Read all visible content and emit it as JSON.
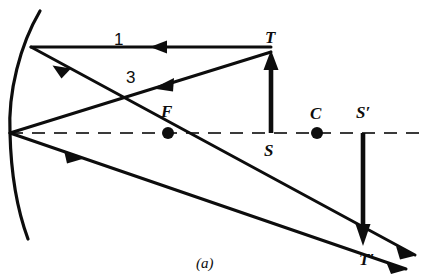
{
  "figure": {
    "caption": "(a)",
    "colors": {
      "ink": "#0d0d0d",
      "background": "#ffffff"
    },
    "labels": [
      {
        "id": "ray-1",
        "text": "1",
        "x": 118,
        "y": 40,
        "style": "num"
      },
      {
        "id": "ray-3",
        "text": "3",
        "x": 130,
        "y": 78,
        "style": "num"
      },
      {
        "id": "point-T",
        "text": "T",
        "x": 271,
        "y": 39,
        "style": "italic"
      },
      {
        "id": "point-F",
        "text": "F",
        "x": 167,
        "y": 113,
        "style": "italic"
      },
      {
        "id": "point-C",
        "text": "C",
        "x": 316,
        "y": 115,
        "style": "italic"
      },
      {
        "id": "point-S2",
        "text": "S′",
        "x": 364,
        "y": 114,
        "style": "italic"
      },
      {
        "id": "point-S",
        "text": "S",
        "x": 270,
        "y": 152,
        "style": "italic"
      },
      {
        "id": "point-T2",
        "text": "T′",
        "x": 367,
        "y": 261,
        "style": "italic"
      }
    ],
    "geometry": {
      "mirror_arc": {
        "top": [
          40,
          11
        ],
        "vertex": [
          10,
          133
        ],
        "bottom": [
          28,
          239
        ]
      },
      "axis": {
        "from": [
          10,
          133
        ],
        "to": [
          424,
          133
        ],
        "dashed": true
      },
      "object_arrow": {
        "tail": [
          271,
          133
        ],
        "head": [
          271,
          52
        ]
      },
      "image_arrow": {
        "tail": [
          363,
          133
        ],
        "head": [
          363,
          243
        ]
      },
      "focal_point": [
        168,
        133
      ],
      "center_point": [
        317,
        133
      ],
      "incident_ray_1": {
        "from": [
          271,
          47
        ],
        "to": [
          31,
          47
        ]
      },
      "reflected_ray_1": {
        "from": [
          31,
          47
        ],
        "to": [
          415,
          255
        ]
      },
      "incident_ray_3": {
        "from": [
          271,
          52
        ],
        "to": [
          10,
          133
        ]
      },
      "reflected_ray_3": {
        "from": [
          10,
          133
        ],
        "to": [
          405,
          268
        ]
      }
    }
  }
}
